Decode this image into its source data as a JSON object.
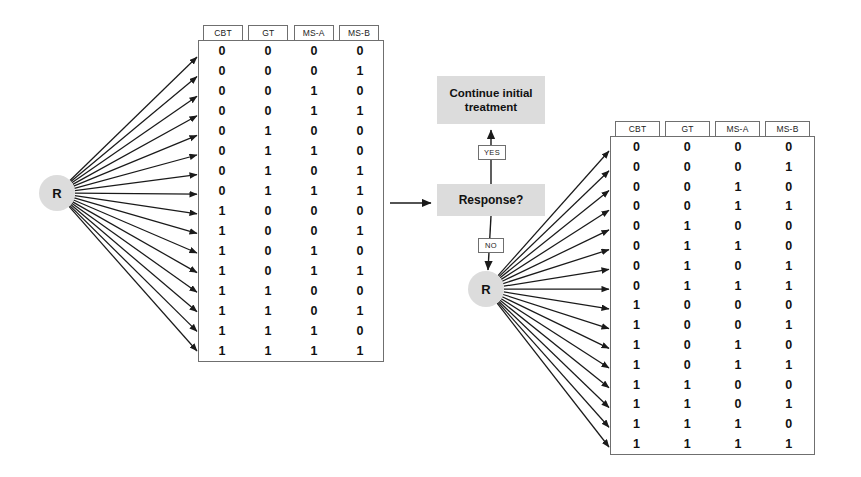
{
  "diagram": {
    "colors": {
      "node_fill": "#dcdcdc",
      "box_fill": "#dcdcdc",
      "line": "#1a1a1a",
      "table_border": "#6f6f6f",
      "background": "#ffffff"
    }
  },
  "nodes": {
    "randomization_left": "R",
    "randomization_right": "R"
  },
  "boxes": {
    "continue_treatment": "Continue initial treatment",
    "response_question": "Response?"
  },
  "edge_labels": {
    "yes": "YES",
    "no": "NO"
  },
  "table_left": {
    "headers": [
      "CBT",
      "GT",
      "MS-A",
      "MS-B"
    ],
    "rows": [
      [
        "0",
        "0",
        "0",
        "0"
      ],
      [
        "0",
        "0",
        "0",
        "1"
      ],
      [
        "0",
        "0",
        "1",
        "0"
      ],
      [
        "0",
        "0",
        "1",
        "1"
      ],
      [
        "0",
        "1",
        "0",
        "0"
      ],
      [
        "0",
        "1",
        "1",
        "0"
      ],
      [
        "0",
        "1",
        "0",
        "1"
      ],
      [
        "0",
        "1",
        "1",
        "1"
      ],
      [
        "1",
        "0",
        "0",
        "0"
      ],
      [
        "1",
        "0",
        "0",
        "1"
      ],
      [
        "1",
        "0",
        "1",
        "0"
      ],
      [
        "1",
        "0",
        "1",
        "1"
      ],
      [
        "1",
        "1",
        "0",
        "0"
      ],
      [
        "1",
        "1",
        "0",
        "1"
      ],
      [
        "1",
        "1",
        "1",
        "0"
      ],
      [
        "1",
        "1",
        "1",
        "1"
      ]
    ]
  },
  "table_right": {
    "headers": [
      "CBT",
      "GT",
      "MS-A",
      "MS-B"
    ],
    "rows": [
      [
        "0",
        "0",
        "0",
        "0"
      ],
      [
        "0",
        "0",
        "0",
        "1"
      ],
      [
        "0",
        "0",
        "1",
        "0"
      ],
      [
        "0",
        "0",
        "1",
        "1"
      ],
      [
        "0",
        "1",
        "0",
        "0"
      ],
      [
        "0",
        "1",
        "1",
        "0"
      ],
      [
        "0",
        "1",
        "0",
        "1"
      ],
      [
        "0",
        "1",
        "1",
        "1"
      ],
      [
        "1",
        "0",
        "0",
        "0"
      ],
      [
        "1",
        "0",
        "0",
        "1"
      ],
      [
        "1",
        "0",
        "1",
        "0"
      ],
      [
        "1",
        "0",
        "1",
        "1"
      ],
      [
        "1",
        "1",
        "0",
        "0"
      ],
      [
        "1",
        "1",
        "0",
        "1"
      ],
      [
        "1",
        "1",
        "1",
        "0"
      ],
      [
        "1",
        "1",
        "1",
        "1"
      ]
    ]
  }
}
